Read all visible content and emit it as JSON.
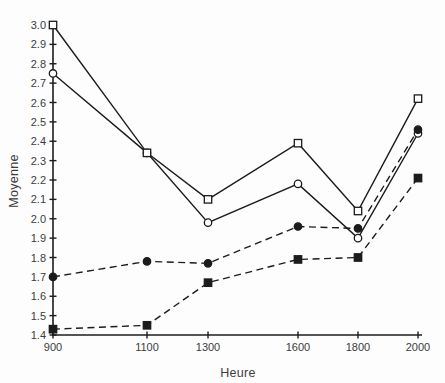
{
  "chart_data": {
    "type": "line",
    "title": "",
    "xlabel": "Heure",
    "ylabel": "Moyenne",
    "x_categories": [
      "900",
      "1100",
      "1300",
      "1600",
      "1800",
      "2000"
    ],
    "ylim": [
      1.4,
      3.0
    ],
    "ytick_step": 0.1,
    "ytick_labels": [
      "1.4",
      "1.5",
      "1.6",
      "1.7",
      "1.8",
      "1.9",
      "2.0",
      "2.1",
      "2.2",
      "2.3",
      "2.4",
      "2.5",
      "2.6",
      "2.7",
      "2.8",
      "2.9",
      "3.0"
    ],
    "grid": false,
    "legend": "none",
    "series": [
      {
        "name": "open-circle-line",
        "marker": "open-circle",
        "line": "solid",
        "values": [
          2.75,
          2.34,
          1.98,
          2.18,
          1.9,
          2.44
        ]
      },
      {
        "name": "open-square-line",
        "marker": "open-square",
        "line": "solid",
        "values": [
          3.0,
          2.34,
          2.1,
          2.39,
          2.04,
          2.62
        ]
      },
      {
        "name": "filled-square-line",
        "marker": "filled-square",
        "line": "dashed",
        "values": [
          1.43,
          1.45,
          1.67,
          1.79,
          1.8,
          2.21
        ]
      },
      {
        "name": "filled-circle-line",
        "marker": "filled-circle",
        "line": "dashed",
        "values": [
          1.7,
          1.78,
          1.77,
          1.96,
          1.95,
          2.46
        ]
      }
    ],
    "colors": {
      "line": "#1c1c1c",
      "text": "#3c3c3c",
      "background": "#fdfdfd"
    }
  }
}
